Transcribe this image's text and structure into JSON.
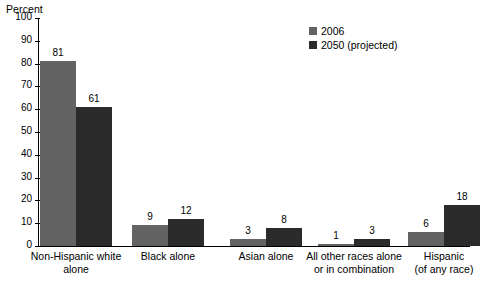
{
  "chart_data": {
    "type": "bar",
    "title": "",
    "subtitle": "",
    "xlabel": "",
    "ylabel": "Percent",
    "ylim": [
      0,
      100
    ],
    "ytick_values": [
      0,
      10,
      20,
      30,
      40,
      50,
      60,
      70,
      80,
      90,
      100
    ],
    "ytick_labels": [
      "0",
      "10",
      "20",
      "30",
      "40",
      "50",
      "60",
      "70",
      "80",
      "90",
      "100"
    ],
    "grid": false,
    "legend_position": "top-right",
    "categories": [
      "Non-Hispanic white\nalone",
      "Black alone",
      "Asian alone",
      "All other races alone\nor in combination",
      "Hispanic\n(of any race)"
    ],
    "series": [
      {
        "name": "2006",
        "color": "#636363",
        "values": [
          81,
          9,
          3,
          1,
          6
        ],
        "value_labels": [
          "81",
          "9",
          "3",
          "1",
          "6"
        ]
      },
      {
        "name": "2050 (projected)",
        "color": "#2b2b2b",
        "values": [
          61,
          12,
          8,
          3,
          18
        ],
        "value_labels": [
          "61",
          "12",
          "8",
          "3",
          "18"
        ]
      }
    ]
  },
  "colors": {
    "series_2006": "#636363",
    "series_2050": "#2b2b2b",
    "axis": "#000000",
    "background": "#ffffff",
    "text": "#000000"
  }
}
